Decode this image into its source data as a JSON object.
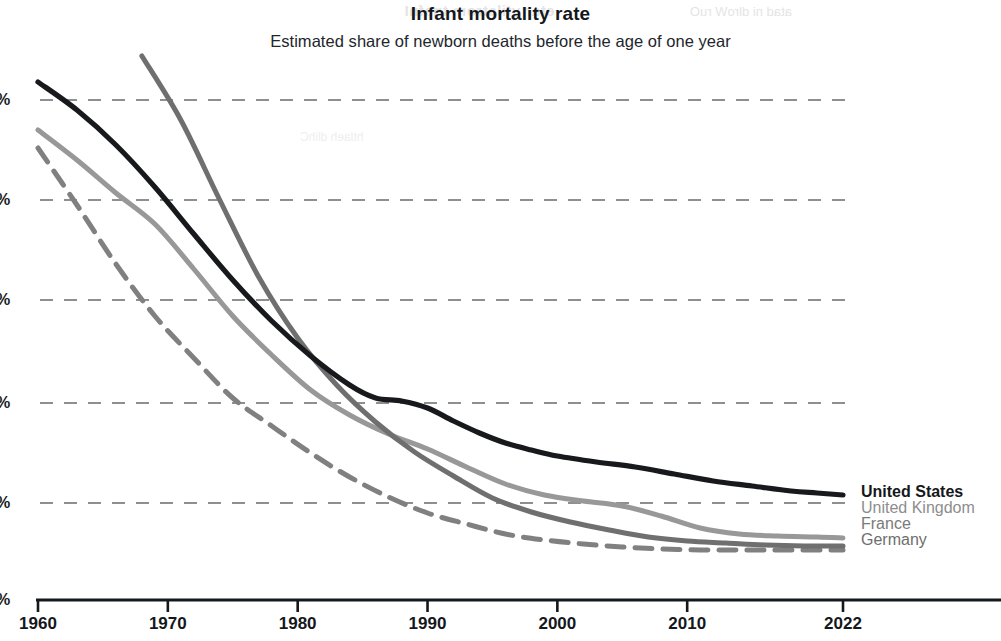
{
  "chart_data": {
    "type": "line",
    "title": "Infant mortality rate",
    "subtitle": "Estimated share of newborn deaths before the age of one year",
    "xlabel": "",
    "ylabel": "",
    "grid": true,
    "legend_position": "right",
    "xlim": [
      1960,
      2022
    ],
    "ylim": [
      0,
      6
    ],
    "xticks": [
      1960,
      1970,
      1980,
      1990,
      2000,
      2010,
      2022
    ],
    "xtick_labels": [
      "1960",
      "1970",
      "1980",
      "1990",
      "2000",
      "2010",
      "2022"
    ],
    "yticks": [
      1,
      2,
      3,
      4,
      5,
      6
    ],
    "ytick_labels": [
      "%",
      "%",
      "%",
      "%",
      "%",
      "%"
    ],
    "ytick_note": "Numeric portion of y-axis labels is cropped off the left edge of the screenshot; only the percent signs are visible.",
    "series": [
      {
        "name": "United States",
        "color": "#17191c",
        "style": "solid",
        "x": [
          1960,
          1963,
          1966,
          1969,
          1972,
          1975,
          1978,
          1981,
          1984,
          1986,
          1988,
          1990,
          1992,
          1994,
          1996,
          1998,
          2000,
          2003,
          2006,
          2009,
          2012,
          2015,
          2018,
          2020,
          2022
        ],
        "values": [
          5.18,
          4.9,
          4.55,
          4.13,
          3.66,
          3.2,
          2.79,
          2.44,
          2.15,
          2.02,
          1.99,
          1.92,
          1.79,
          1.67,
          1.57,
          1.5,
          1.44,
          1.38,
          1.33,
          1.26,
          1.19,
          1.14,
          1.09,
          1.07,
          1.05
        ]
      },
      {
        "name": "United Kingdom",
        "color": "#989898",
        "style": "solid",
        "x": [
          1960,
          1963,
          1966,
          1969,
          1972,
          1975,
          1978,
          1981,
          1984,
          1987,
          1990,
          1993,
          1996,
          1999,
          2002,
          2005,
          2008,
          2011,
          2014,
          2017,
          2020,
          2022
        ],
        "values": [
          4.7,
          4.4,
          4.07,
          3.76,
          3.31,
          2.84,
          2.45,
          2.1,
          1.85,
          1.66,
          1.51,
          1.33,
          1.16,
          1.05,
          0.99,
          0.94,
          0.84,
          0.72,
          0.66,
          0.64,
          0.63,
          0.62
        ]
      },
      {
        "name": "France",
        "color": "#808080",
        "style": "dashed",
        "x": [
          1960,
          1963,
          1966,
          1969,
          1972,
          1975,
          1978,
          1981,
          1984,
          1987,
          1990,
          1993,
          1996,
          1999,
          2002,
          2005,
          2008,
          2011,
          2014,
          2017,
          2020,
          2022
        ],
        "values": [
          4.52,
          3.95,
          3.36,
          2.84,
          2.42,
          2.02,
          1.74,
          1.47,
          1.23,
          1.03,
          0.87,
          0.76,
          0.66,
          0.6,
          0.56,
          0.53,
          0.51,
          0.5,
          0.5,
          0.5,
          0.5,
          0.5
        ]
      },
      {
        "name": "Germany",
        "color": "#6f6f6f",
        "style": "solid",
        "x": [
          1968,
          1971,
          1974,
          1977,
          1980,
          1983,
          1986,
          1989,
          1992,
          1995,
          1998,
          2001,
          2004,
          2007,
          2010,
          2013,
          2016,
          2019,
          2022
        ],
        "values": [
          5.44,
          4.8,
          4.0,
          3.23,
          2.62,
          2.15,
          1.78,
          1.48,
          1.24,
          1.02,
          0.88,
          0.78,
          0.7,
          0.63,
          0.59,
          0.57,
          0.55,
          0.54,
          0.54
        ]
      }
    ]
  },
  "legend": {
    "items": [
      {
        "label": "United States"
      },
      {
        "label": "United Kingdom"
      },
      {
        "label": "France"
      },
      {
        "label": "Germany"
      }
    ]
  },
  "watermark": {
    "line1": "etar ytilatrom tnafnI",
    "line2": "atad ni dlroW ruO",
    "line3": "htlaeh dlihC"
  }
}
